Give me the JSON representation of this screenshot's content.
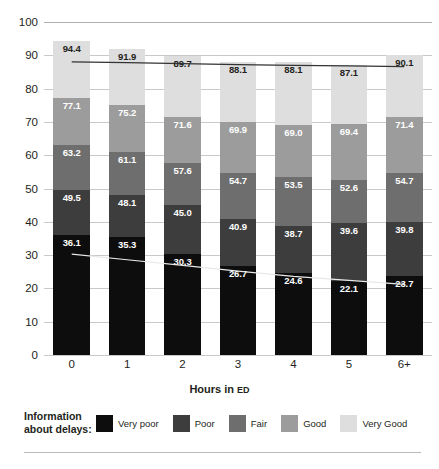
{
  "chart_data": {
    "type": "bar",
    "stacked": true,
    "title": "",
    "xlabel": "Hours in ED",
    "ylabel": "Satisfaction with Wait",
    "categories": [
      "0",
      "1",
      "2",
      "3",
      "4",
      "5",
      "6+"
    ],
    "ylim": [
      0,
      100
    ],
    "ytick_values": [
      0,
      10,
      20,
      30,
      40,
      50,
      60,
      70,
      80,
      90,
      100
    ],
    "ytick_labels": [
      "0",
      "10",
      "20",
      "30",
      "40",
      "50",
      "60",
      "70",
      "80",
      "90",
      "100"
    ],
    "grid": true,
    "legend_position": "bottom",
    "legend_title": "Information\nabout delays:",
    "label_mode": "cumulative",
    "series": [
      {
        "name": "Very poor",
        "color": "#0d0d0d",
        "values": [
          36.1,
          35.3,
          30.3,
          26.7,
          24.6,
          22.1,
          23.7
        ],
        "cumulative": [
          36.1,
          35.3,
          30.3,
          26.7,
          24.6,
          22.1,
          23.7
        ],
        "label_color": "on-dark"
      },
      {
        "name": "Poor",
        "color": "#3d3d3d",
        "values": [
          13.4,
          12.8,
          14.7,
          14.2,
          14.1,
          17.5,
          16.1
        ],
        "cumulative": [
          49.5,
          48.1,
          45.0,
          40.9,
          38.7,
          39.6,
          39.8
        ],
        "label_color": "on-dark"
      },
      {
        "name": "Fair",
        "color": "#6e6e6e",
        "values": [
          13.7,
          13.0,
          12.6,
          13.8,
          14.8,
          13.0,
          14.9
        ],
        "cumulative": [
          63.2,
          61.1,
          57.6,
          54.7,
          53.5,
          52.6,
          54.7
        ],
        "label_color": "on-dark"
      },
      {
        "name": "Good",
        "color": "#9c9c9c",
        "values": [
          13.9,
          14.1,
          14.0,
          15.2,
          15.5,
          16.8,
          16.7
        ],
        "cumulative": [
          77.1,
          75.2,
          71.6,
          69.9,
          69.0,
          69.4,
          71.4
        ],
        "label_color": "on-dark"
      },
      {
        "name": "Very Good",
        "color": "#dedede",
        "values": [
          17.3,
          16.7,
          18.1,
          18.2,
          19.1,
          17.7,
          18.7
        ],
        "cumulative": [
          94.4,
          91.9,
          89.7,
          88.1,
          88.1,
          87.1,
          90.1
        ],
        "label_color": "on-light"
      }
    ],
    "trend_lines": [
      {
        "name": "upper-trend-line",
        "color": "#333333",
        "values": [
          88.0,
          87.8,
          87.5,
          87.2,
          87.0,
          86.8,
          86.6
        ]
      },
      {
        "name": "lower-trend-line",
        "color": "#e8e8e8",
        "values": [
          30.3,
          28.6,
          26.9,
          25.2,
          23.6,
          22.4,
          21.2
        ]
      }
    ]
  },
  "axes": {
    "y_title": "Satisfaction with Wait",
    "x_title_main": "Hours in ",
    "x_title_abbrev": "ED"
  },
  "legend": {
    "title": "Information\nabout delays:"
  }
}
